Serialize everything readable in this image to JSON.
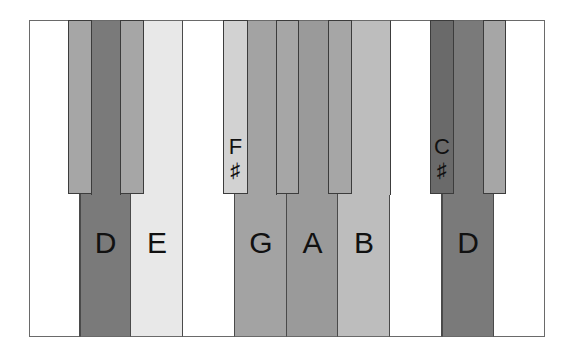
{
  "diagram": {
    "type": "piano-keyboard",
    "white_keys": [
      {
        "note": "",
        "color": "#ffffff",
        "label": ""
      },
      {
        "note": "D",
        "color": "#7a7a7a",
        "label": "D"
      },
      {
        "note": "E",
        "color": "#e8e8e8",
        "label": "E"
      },
      {
        "note": "",
        "color": "#ffffff",
        "label": ""
      },
      {
        "note": "G",
        "color": "#a3a3a3",
        "label": "G"
      },
      {
        "note": "A",
        "color": "#9a9a9a",
        "label": "A"
      },
      {
        "note": "B",
        "color": "#bdbdbd",
        "label": "B"
      },
      {
        "note": "",
        "color": "#ffffff",
        "label": ""
      },
      {
        "note": "D",
        "color": "#7a7a7a",
        "label": "D"
      },
      {
        "note": "",
        "color": "#ffffff",
        "label": ""
      }
    ],
    "black_keys": [
      {
        "note": "C#",
        "color": "#a6a6a6",
        "label_note": "",
        "label_sharp": ""
      },
      {
        "note": "D#",
        "color": "#a6a6a6",
        "label_note": "",
        "label_sharp": ""
      },
      {
        "note": "F#",
        "color": "#d2d2d2",
        "label_note": "F",
        "label_sharp": "♯"
      },
      {
        "note": "G#",
        "color": "#a6a6a6",
        "label_note": "",
        "label_sharp": ""
      },
      {
        "note": "A#",
        "color": "#a6a6a6",
        "label_note": "",
        "label_sharp": ""
      },
      {
        "note": "C#",
        "color": "#6a6a6a",
        "label_note": "C",
        "label_sharp": "♯"
      },
      {
        "note": "D#",
        "color": "#a6a6a6",
        "label_note": "",
        "label_sharp": ""
      }
    ],
    "labels": {
      "d1": "D",
      "e": "E",
      "g": "G",
      "a": "A",
      "b": "B",
      "d2": "D",
      "fsharp_note": "F",
      "fsharp_sym": "♯",
      "csharp_note": "C",
      "csharp_sym": "♯"
    }
  }
}
